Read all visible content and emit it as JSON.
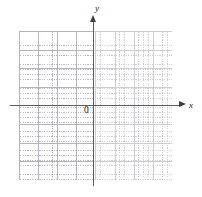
{
  "figure": {
    "type": "blank-cartesian-coordinate-grid",
    "labels": {
      "x_axis": "x",
      "y_axis": "y",
      "origin": "0"
    },
    "colors": {
      "background": "#ffffff",
      "axis": "#5a5a5f",
      "arrowhead": "#3f3f45",
      "major_gridline": "#b4b4bc",
      "minor_gridline": "#c9c9cf",
      "label_text": "#1a1a1a"
    }
  },
  "chart_data": {
    "type": "scatter",
    "title": "",
    "subtitle": "",
    "xlabel": "x",
    "ylabel": "y",
    "series": [],
    "x": [],
    "values": [],
    "annotations": [
      "0"
    ],
    "xlim": [
      -4,
      4
    ],
    "ylim": [
      -4,
      4
    ],
    "xticks": [
      -4,
      -3,
      -2,
      -1,
      0,
      1,
      2,
      3,
      4
    ],
    "yticks": [
      -4,
      -3,
      -2,
      -1,
      0,
      1,
      2,
      3,
      4
    ],
    "tick_labels_shown": false,
    "grid": true,
    "grid_major_cells_x": 8,
    "grid_major_cells_y": 8,
    "grid_minor_per_major": 4,
    "legend": false,
    "legend_position": "none",
    "axis_arrows": true,
    "origin_label": "0"
  }
}
